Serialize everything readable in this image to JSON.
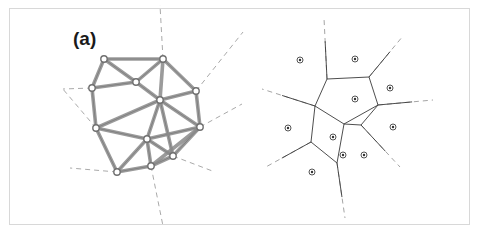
{
  "figure": {
    "width": 495,
    "height": 239,
    "background_color": "#ffffff",
    "frame_color": "#d8d8d8"
  },
  "panels": [
    {
      "id": "panel-a",
      "label": "(a)",
      "label_x": 73,
      "label_y": 28,
      "node_marker": {
        "shape": "circle",
        "radius": 3.2,
        "fill": "#ffffff",
        "stroke": "#6f6f6f",
        "stroke_width": 1.4
      },
      "graph_edge_style": {
        "stroke": "#8a8a8a",
        "stroke_width": 3.6,
        "linecap": "round"
      },
      "dual_edge_style": {
        "stroke": "#2b2b2b",
        "stroke_width": 0.85
      },
      "ray_style": {
        "stroke": "#9a9a9a",
        "stroke_width": 0.85,
        "dash": "5,4"
      },
      "nodes": [
        {
          "id": 0,
          "x": 104,
          "y": 59
        },
        {
          "id": 1,
          "x": 163,
          "y": 59
        },
        {
          "id": 2,
          "x": 196,
          "y": 91
        },
        {
          "id": 3,
          "x": 200,
          "y": 127
        },
        {
          "id": 4,
          "x": 173,
          "y": 156
        },
        {
          "id": 5,
          "x": 151,
          "y": 166
        },
        {
          "id": 6,
          "x": 117,
          "y": 172
        },
        {
          "id": 7,
          "x": 96,
          "y": 128
        },
        {
          "id": 8,
          "x": 92,
          "y": 88
        },
        {
          "id": 9,
          "x": 160,
          "y": 100
        },
        {
          "id": 10,
          "x": 147,
          "y": 139
        },
        {
          "id": 11,
          "x": 136,
          "y": 82
        }
      ],
      "graph_edges": [
        [
          0,
          1
        ],
        [
          1,
          2
        ],
        [
          2,
          3
        ],
        [
          3,
          4
        ],
        [
          4,
          5
        ],
        [
          5,
          6
        ],
        [
          6,
          7
        ],
        [
          7,
          8
        ],
        [
          8,
          0
        ],
        [
          0,
          11
        ],
        [
          1,
          11
        ],
        [
          1,
          9
        ],
        [
          2,
          9
        ],
        [
          3,
          9
        ],
        [
          9,
          11
        ],
        [
          8,
          11
        ],
        [
          7,
          9
        ],
        [
          7,
          10
        ],
        [
          9,
          10
        ],
        [
          10,
          3
        ],
        [
          10,
          4
        ],
        [
          10,
          5
        ],
        [
          10,
          6
        ],
        [
          3,
          5
        ],
        [
          9,
          4
        ]
      ],
      "dual_edges": [
        [
          104,
          59,
          92,
          88
        ],
        [
          92,
          88,
          96,
          128
        ],
        [
          96,
          128,
          117,
          172
        ],
        [
          117,
          172,
          151,
          166
        ],
        [
          151,
          166,
          173,
          156
        ],
        [
          173,
          156,
          200,
          127
        ],
        [
          200,
          127,
          196,
          91
        ],
        [
          196,
          91,
          163,
          59
        ],
        [
          163,
          59,
          104,
          59
        ]
      ],
      "rays": [
        {
          "from_x": 163,
          "from_y": 59,
          "to_x": 160,
          "to_y": 5
        },
        {
          "from_x": 196,
          "from_y": 91,
          "to_x": 243,
          "to_y": 32
        },
        {
          "from_x": 200,
          "from_y": 127,
          "to_x": 242,
          "to_y": 104
        },
        {
          "from_x": 173,
          "from_y": 156,
          "to_x": 215,
          "to_y": 172
        },
        {
          "from_x": 151,
          "from_y": 166,
          "to_x": 163,
          "to_y": 226
        },
        {
          "from_x": 117,
          "from_y": 172,
          "to_x": 70,
          "to_y": 168
        },
        {
          "from_x": 96,
          "from_y": 128,
          "to_x": 62,
          "to_y": 88
        },
        {
          "from_x": 92,
          "from_y": 88,
          "to_x": 63,
          "to_y": 89
        }
      ]
    },
    {
      "id": "panel-b",
      "label": "(b)",
      "label_x": 263,
      "label_y": 28,
      "site_marker": {
        "shape": "circle-with-dot",
        "radius": 3.0,
        "inner_radius": 1.2,
        "fill": "#ffffff",
        "stroke": "#555555",
        "stroke_width": 1.0,
        "inner_fill": "#333333"
      },
      "cell_edge_style": {
        "stroke": "#3a3a3a",
        "stroke_width": 0.9
      },
      "ray_style": {
        "stroke": "#9a9a9a",
        "stroke_width": 0.9,
        "dash": "5,4"
      },
      "sites": [
        {
          "id": 0,
          "x": 300,
          "y": 60
        },
        {
          "id": 1,
          "x": 355,
          "y": 59
        },
        {
          "id": 2,
          "x": 390,
          "y": 88
        },
        {
          "id": 3,
          "x": 393,
          "y": 127
        },
        {
          "id": 4,
          "x": 364,
          "y": 155
        },
        {
          "id": 5,
          "x": 343,
          "y": 155
        },
        {
          "id": 6,
          "x": 312,
          "y": 172
        },
        {
          "id": 7,
          "x": 288,
          "y": 128
        },
        {
          "id": 8,
          "x": 355,
          "y": 99
        },
        {
          "id": 9,
          "x": 333,
          "y": 137
        }
      ],
      "vertices": [
        {
          "id": "v0",
          "x": 327,
          "y": 79
        },
        {
          "id": "v1",
          "x": 369,
          "y": 77
        },
        {
          "id": "v2",
          "x": 378,
          "y": 105
        },
        {
          "id": "v3",
          "x": 344,
          "y": 124
        },
        {
          "id": "v4",
          "x": 315,
          "y": 106
        },
        {
          "id": "v5",
          "x": 311,
          "y": 142
        },
        {
          "id": "v6",
          "x": 337,
          "y": 163
        },
        {
          "id": "v7",
          "x": 361,
          "y": 125
        }
      ],
      "cell_edges": [
        [
          "v0",
          "v1"
        ],
        [
          "v1",
          "v2"
        ],
        [
          "v2",
          "v3"
        ],
        [
          "v3",
          "v4"
        ],
        [
          "v4",
          "v0"
        ],
        [
          "v4",
          "v5"
        ],
        [
          "v5",
          "v6"
        ],
        [
          "v6",
          "v3"
        ],
        [
          "v3",
          "v7"
        ],
        [
          "v7",
          "v2"
        ]
      ],
      "rays": [
        {
          "from_x": 327,
          "from_y": 79,
          "to_x": 324,
          "to_y": 18
        },
        {
          "from_x": 369,
          "from_y": 77,
          "to_x": 403,
          "to_y": 36
        },
        {
          "from_x": 378,
          "from_y": 105,
          "to_x": 433,
          "to_y": 100
        },
        {
          "from_x": 361,
          "from_y": 125,
          "to_x": 400,
          "to_y": 167
        },
        {
          "from_x": 337,
          "from_y": 163,
          "to_x": 345,
          "to_y": 218
        },
        {
          "from_x": 311,
          "from_y": 142,
          "to_x": 264,
          "to_y": 168
        },
        {
          "from_x": 315,
          "from_y": 106,
          "to_x": 262,
          "to_y": 89
        }
      ]
    }
  ]
}
